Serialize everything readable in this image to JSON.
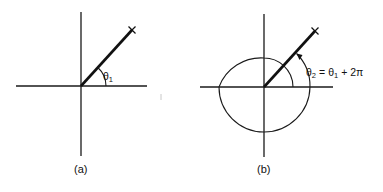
{
  "figure": {
    "panels": [
      {
        "id": "a",
        "caption": "(a)",
        "angle_label": "θ",
        "angle_subscript": "1",
        "geometry": {
          "origin": [
            81,
            86
          ],
          "x_axis": [
            16,
            147
          ],
          "y_axis": [
            12,
            156
          ],
          "ray_end": [
            132,
            30
          ],
          "arc_radius": 25
        }
      },
      {
        "id": "b",
        "caption": "(b)",
        "angle_label": "θ",
        "angle_subscript": "2",
        "equation_rhs_symbol": "θ",
        "equation_rhs_subscript": "1",
        "equation_equals": "=",
        "equation_rest": "+ 2π",
        "geometry": {
          "origin": [
            264,
            87
          ],
          "x_axis": [
            200,
            333
          ],
          "y_axis": [
            14,
            157
          ],
          "ray_end": [
            315,
            31
          ],
          "small_arc_radius": 29,
          "circle_radius": 46
        }
      }
    ],
    "colors": {
      "line": "#111111",
      "background": "#ffffff"
    }
  }
}
